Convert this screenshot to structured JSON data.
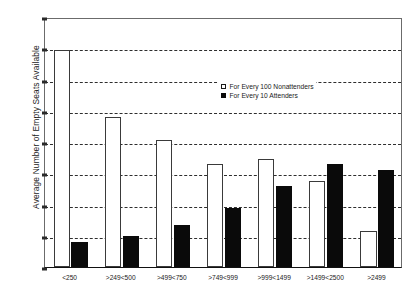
{
  "chart_data": {
    "type": "bar",
    "title": "",
    "xlabel": "",
    "ylabel": "Average Number of Empty Seats Available",
    "ylim": [
      2,
      18
    ],
    "ytick_step": 2,
    "yticks": [
      2,
      4,
      6,
      8,
      10,
      12,
      14,
      16,
      18
    ],
    "gridlines": [
      4,
      6,
      8,
      10,
      12,
      14,
      16
    ],
    "grid": true,
    "legend_position": "upper center",
    "categories": [
      "<250",
      ">249<500",
      ">499<750",
      ">749<999",
      ">999<1499",
      ">1499<2500",
      ">2499"
    ],
    "series": [
      {
        "name": "For Every 100 Nonattenders",
        "color": "#ffffff",
        "edge_color": "#3a3a3a",
        "values": [
          15.9,
          11.6,
          10.1,
          8.6,
          8.9,
          7.5,
          4.3
        ]
      },
      {
        "name": "For Every 10 Attenders",
        "color": "#0a0a0a",
        "edge_color": "#0a0a0a",
        "values": [
          3.6,
          4.0,
          4.7,
          5.8,
          7.2,
          8.6,
          8.2
        ]
      }
    ]
  },
  "legend": {
    "entries": [
      {
        "label": "For Every 100 Nonattenders",
        "swatch": "open-square-icon"
      },
      {
        "label": "For Every 10 Attenders",
        "swatch": "filled-square-icon"
      }
    ]
  },
  "colors": {
    "axis": "#111111",
    "grid": "#2e2e2e",
    "nonattenders": "#ffffff",
    "attenders": "#0a0a0a",
    "background": "#ffffff"
  }
}
